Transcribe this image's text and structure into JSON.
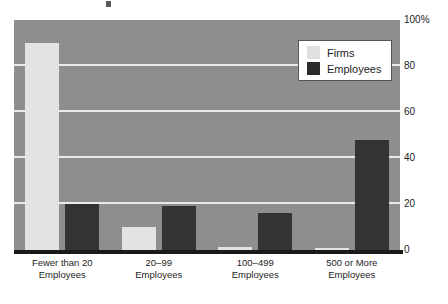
{
  "chart_data": {
    "type": "bar",
    "title": "",
    "subtitle": "",
    "xlabel": "",
    "ylabel": "",
    "ylim": [
      0,
      100
    ],
    "y_unit": "%",
    "grid": true,
    "legend_position": "top-right-inside",
    "y_ticks": [
      {
        "value": 100,
        "label": "100%"
      },
      {
        "value": 80,
        "label": "80"
      },
      {
        "value": 60,
        "label": "60"
      },
      {
        "value": 40,
        "label": "40"
      },
      {
        "value": 20,
        "label": "20"
      },
      {
        "value": 0,
        "label": "0"
      }
    ],
    "categories": [
      {
        "line1": "Fewer than 20",
        "line2": "Employees"
      },
      {
        "line1": "20–99",
        "line2": "Employees"
      },
      {
        "line1": "100–499",
        "line2": "Employees"
      },
      {
        "line1": "500 or More",
        "line2": "Employees"
      }
    ],
    "series": [
      {
        "name": "Firms",
        "color": "#e3e3e3",
        "values": [
          90,
          10,
          1.5,
          1
        ]
      },
      {
        "name": "Employees",
        "color": "#333333",
        "values": [
          20,
          19,
          16,
          48
        ]
      }
    ]
  },
  "legend": {
    "items": [
      {
        "label": "Firms",
        "swatch": "firms"
      },
      {
        "label": "Employees",
        "swatch": "employees"
      }
    ]
  },
  "colors": {
    "plot_background": "#8e8e8e",
    "gridline": "#e9e9e9",
    "baseline": "#1a1a1a",
    "firms_bar": "#e3e3e3",
    "employees_bar": "#333333",
    "text": "#1d1d1d",
    "page_background": "#ffffff"
  }
}
